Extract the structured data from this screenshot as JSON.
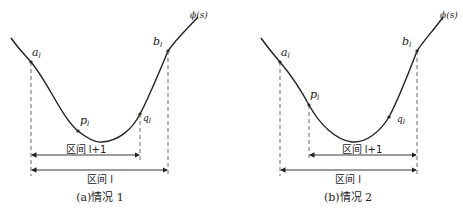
{
  "figure": {
    "curve_label": "ϕ(s)",
    "panels": [
      {
        "id": "a",
        "caption": "(a)情况 1",
        "points": {
          "a": "a",
          "b": "b",
          "p": "p",
          "q": "q",
          "sub": "l"
        },
        "interval_inner": "区间 l+1",
        "interval_outer": "区间 l"
      },
      {
        "id": "b",
        "caption": "(b)情况 2",
        "points": {
          "a": "a",
          "b": "b",
          "p": "p",
          "q": "q",
          "sub": "l"
        },
        "interval_inner": "区间 l+1",
        "interval_outer": "区间 l"
      }
    ]
  }
}
